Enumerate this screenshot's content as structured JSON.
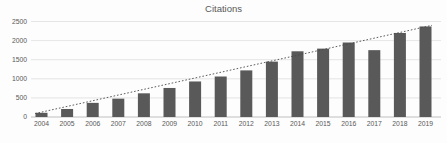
{
  "chart_data": {
    "type": "bar",
    "title": "Citations",
    "categories": [
      "2004",
      "2005",
      "2006",
      "2007",
      "2008",
      "2009",
      "2010",
      "2011",
      "2012",
      "2013",
      "2014",
      "2015",
      "2016",
      "2017",
      "2018",
      "2019"
    ],
    "values": [
      110,
      210,
      370,
      480,
      620,
      760,
      930,
      1060,
      1220,
      1450,
      1720,
      1790,
      1950,
      1750,
      2200,
      2370
    ],
    "xlabel": "",
    "ylabel": "",
    "ylim": [
      0,
      2500
    ],
    "yticks": [
      0,
      500,
      1000,
      1500,
      2000,
      2500
    ],
    "grid": true,
    "legend": false,
    "trendline": {
      "type": "linear",
      "style": "dotted",
      "start_value": 90,
      "end_value": 2400
    },
    "colors": {
      "bar": "#595959",
      "gridline": "#dedede",
      "axis_line": "#bfbfbf",
      "text": "#595959",
      "trendline": "#4a4a4a",
      "background": "#fdfdfd"
    }
  }
}
